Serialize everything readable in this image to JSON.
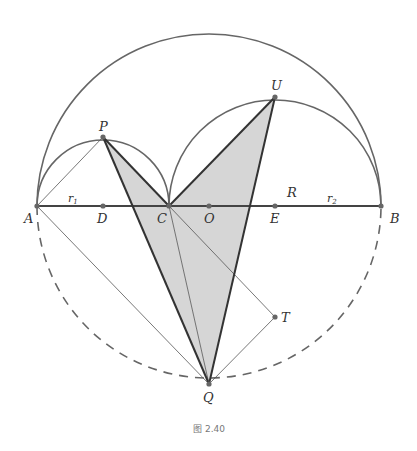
{
  "figure": {
    "caption": "图 2.40",
    "colors": {
      "stroke": "#555555",
      "thick_stroke": "#333333",
      "fill": "#d6d6d6",
      "point": "#666666"
    },
    "points": {
      "A": "A",
      "B": "B",
      "C": "C",
      "D": "D",
      "O": "O",
      "E": "E",
      "P": "P",
      "U": "U",
      "Q": "Q",
      "T": "T"
    },
    "labels": {
      "r1": "r",
      "r1_sub": "1",
      "r2": "r",
      "r2_sub": "2",
      "R": "R"
    }
  }
}
